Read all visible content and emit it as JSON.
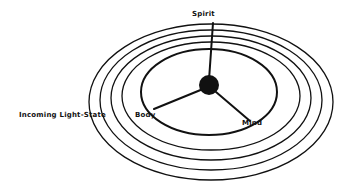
{
  "diagram": {
    "labels": {
      "spirit": "Spirit",
      "body": "Body",
      "mind": "Mind",
      "incoming": "Incoming Light-State"
    },
    "colors": {
      "stroke": "#111111",
      "background": "#ffffff"
    },
    "rings_count": 5
  }
}
